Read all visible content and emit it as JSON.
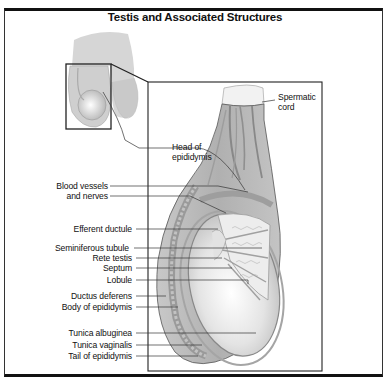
{
  "title": "Testis and Associated Structures",
  "labels": {
    "spermatic_cord_1": "Spermatic",
    "spermatic_cord_2": "cord",
    "head_epididymis_1": "Head of",
    "head_epididymis_2": "epididymis",
    "blood_vessels_1": "Blood vessels",
    "blood_vessels_2": "and nerves",
    "efferent_ductule": "Efferent ductule",
    "seminiferous_tubule": "Seminiferous tubule",
    "rete_testis": "Rete testis",
    "septum": "Septum",
    "lobule": "Lobule",
    "ductus_deferens": "Ductus deferens",
    "body_epididymis": "Body of epididymis",
    "tunica_albuginea": "Tunica albuginea",
    "tunica_vaginalis": "Tunica vaginalis",
    "tail_epididymis": "Tail of epididymis"
  },
  "colors": {
    "line": "#222222",
    "tissue_light": "#d9d9d9",
    "tissue_mid": "#b5b5b5",
    "tissue_dark": "#8a8a8a"
  }
}
